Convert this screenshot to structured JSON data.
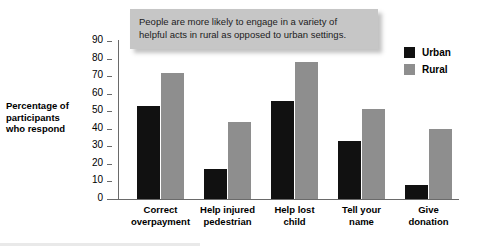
{
  "chart_data": {
    "type": "bar",
    "title": "",
    "xlabel": "",
    "ylabel": "Percentage of participants who respond",
    "ylim": [
      0,
      90
    ],
    "ytick_step": 10,
    "yticks": [
      90,
      80,
      70,
      60,
      50,
      40,
      30,
      20,
      10,
      0
    ],
    "grid": false,
    "legend_position": "top-right",
    "categories": [
      "Correct overpayment",
      "Help injured pedestrian",
      "Help lost child",
      "Tell your name",
      "Give donation"
    ],
    "category_label_lines": [
      [
        "Correct",
        "overpayment"
      ],
      [
        "Help injured",
        "pedestrian"
      ],
      [
        "Help lost",
        "child"
      ],
      [
        "Tell your",
        "name"
      ],
      [
        "Give",
        "donation"
      ]
    ],
    "series": [
      {
        "name": "Urban",
        "color": "#111111",
        "values": [
          53,
          17,
          56,
          33,
          8
        ]
      },
      {
        "name": "Rural",
        "color": "#8e8e8e",
        "values": [
          72,
          44,
          78,
          51,
          40
        ]
      }
    ],
    "annotation": "People are more likely to engage in a variety of helpful acts in rural as opposed to urban settings."
  },
  "y_axis_title_lines": [
    "Percentage of",
    "participants",
    "who respond"
  ],
  "annotation_lines": [
    "People are more likely to engage in a variety of",
    "helpful acts in rural as opposed to urban settings."
  ],
  "legend": {
    "items": [
      {
        "label": "Urban",
        "color": "#111111"
      },
      {
        "label": "Rural",
        "color": "#8e8e8e"
      }
    ]
  },
  "colors": {
    "urban": "#111111",
    "rural": "#8e8e8e",
    "axis": "#6a6a6a",
    "callout_bg": "#c6c6c6",
    "background": "#ffffff"
  }
}
